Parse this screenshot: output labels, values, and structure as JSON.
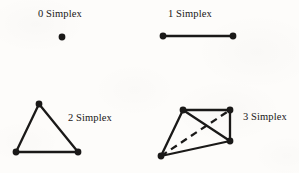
{
  "page": {
    "background_color": "#fdfcfa",
    "ink_color": "#1a1918",
    "width": 299,
    "height": 173
  },
  "figures": [
    {
      "id": "zero-simplex",
      "label": "0 Simplex",
      "label_x": 38,
      "label_y": 8,
      "dimension": 0,
      "vertices": [
        [
          62,
          37
        ]
      ],
      "edges": [],
      "hidden_edges": []
    },
    {
      "id": "one-simplex",
      "label": "1 Simplex",
      "label_x": 168,
      "label_y": 8,
      "dimension": 1,
      "vertices": [
        [
          163,
          36
        ],
        [
          233,
          36
        ]
      ],
      "edges": [
        [
          0,
          1
        ]
      ],
      "hidden_edges": []
    },
    {
      "id": "two-simplex",
      "label": "2 Simplex",
      "label_x": 68,
      "label_y": 112,
      "dimension": 2,
      "vertices": [
        [
          39,
          104
        ],
        [
          16,
          152
        ],
        [
          78,
          152
        ]
      ],
      "edges": [
        [
          0,
          1
        ],
        [
          1,
          2
        ],
        [
          2,
          0
        ]
      ],
      "hidden_edges": []
    },
    {
      "id": "three-simplex",
      "label": "3 Simplex",
      "label_x": 243,
      "label_y": 111,
      "dimension": 3,
      "vertices": [
        [
          183,
          110
        ],
        [
          230,
          110
        ],
        [
          230,
          141
        ],
        [
          161,
          156
        ]
      ],
      "edges": [
        [
          0,
          1
        ],
        [
          1,
          2
        ],
        [
          2,
          3
        ],
        [
          3,
          0
        ],
        [
          0,
          2
        ]
      ],
      "hidden_edges": [
        [
          3,
          1
        ]
      ]
    }
  ],
  "style": {
    "vertex_radius": 3.4,
    "edge_width": 2.3,
    "dashed_edge_width": 2.3,
    "dash_pattern": "7,5"
  }
}
